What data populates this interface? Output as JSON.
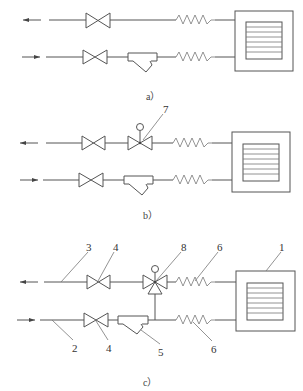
{
  "figure": {
    "subfigures": [
      {
        "id": "a",
        "caption": "a）",
        "components": [
          "supply-arrow-out",
          "gate-valve",
          "flexible-hose",
          "fan-coil-unit",
          "return-arrow-in",
          "gate-valve",
          "y-strainer",
          "flexible-hose"
        ],
        "labels": []
      },
      {
        "id": "b",
        "caption": "b）",
        "components": [
          "gate-valve",
          "two-way-control-valve",
          "flexible-hose",
          "fan-coil-unit",
          "gate-valve",
          "y-strainer",
          "flexible-hose"
        ],
        "labels": [
          {
            "text": "7",
            "target": "two-way-control-valve"
          }
        ]
      },
      {
        "id": "c",
        "caption": "c）",
        "components": [
          "pipe",
          "gate-valve",
          "three-way-control-valve",
          "flexible-hose",
          "fan-coil-unit",
          "pipe",
          "gate-valve",
          "y-strainer",
          "flexible-hose"
        ],
        "labels": [
          {
            "text": "1",
            "target": "fan-coil-unit"
          },
          {
            "text": "2",
            "target": "return-pipe"
          },
          {
            "text": "3",
            "target": "supply-pipe"
          },
          {
            "text": "4",
            "target": "gate-valve-top"
          },
          {
            "text": "4",
            "target": "gate-valve-bottom"
          },
          {
            "text": "5",
            "target": "y-strainer"
          },
          {
            "text": "6",
            "target": "flexible-hose-top"
          },
          {
            "text": "6",
            "target": "flexible-hose-bottom"
          },
          {
            "text": "8",
            "target": "three-way-control-valve"
          }
        ]
      }
    ]
  },
  "captions": {
    "a": "a）",
    "b": "b）",
    "c": "c）"
  },
  "labels": {
    "b7": "7",
    "c1": "1",
    "c2": "2",
    "c3": "3",
    "c4a": "4",
    "c4b": "4",
    "c5": "5",
    "c6a": "6",
    "c6b": "6",
    "c8": "8"
  },
  "colors": {
    "line": "#555555",
    "background": "#ffffff"
  }
}
